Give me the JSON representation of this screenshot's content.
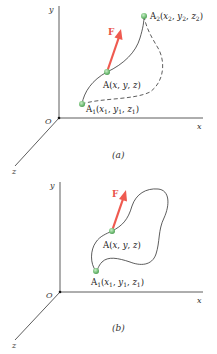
{
  "colors": {
    "axis": "#333333",
    "path": "#333333",
    "force": "#ef5a50",
    "point": "#7cc47f",
    "point_stroke": "#4f9e55"
  },
  "panels": [
    {
      "caption": "(a)",
      "axes": {
        "origin": "O",
        "x": "x",
        "y": "y",
        "z": "z"
      },
      "force_label": "F",
      "points": {
        "A1": {
          "name": "A",
          "sub": "1",
          "coords_prefix": "(x",
          "coords": [
            "1",
            "1",
            "1"
          ],
          "text": "A1(x1, y1, z1)"
        },
        "A": {
          "text": "A(x, y, z)"
        },
        "A2": {
          "name": "A",
          "sub": "2",
          "text": "A2(x2, y2, z2)"
        }
      },
      "paths": [
        "solid path A1 → A → A2",
        "dashed alternate path A1 → A2"
      ]
    },
    {
      "caption": "(b)",
      "axes": {
        "origin": "O",
        "x": "x",
        "y": "y",
        "z": "z"
      },
      "force_label": "F",
      "points": {
        "A1": {
          "text": "A1(x1, y1, z1)"
        },
        "A": {
          "text": "A(x, y, z)"
        }
      },
      "paths": [
        "closed path starting and ending at A1"
      ]
    }
  ]
}
